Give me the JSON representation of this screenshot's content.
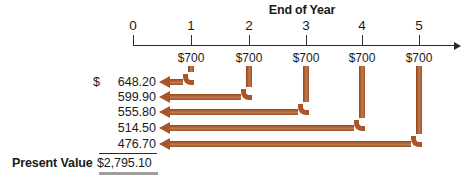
{
  "chart_data": {
    "type": "diagram",
    "title": "End of Year",
    "axis": {
      "tick_labels": [
        "0",
        "1",
        "2",
        "3",
        "4",
        "5"
      ],
      "tick_x": [
        133,
        191,
        249,
        306,
        362,
        419
      ],
      "line_start_x": 133,
      "line_end_x": 455,
      "line_y": 45
    },
    "cash_flows": [
      {
        "year": 1,
        "label": "$700",
        "amount": 700
      },
      {
        "year": 2,
        "label": "$700",
        "amount": 700
      },
      {
        "year": 3,
        "label": "$700",
        "amount": 700
      },
      {
        "year": 4,
        "label": "$700",
        "amount": 700
      },
      {
        "year": 5,
        "label": "$700",
        "amount": 700
      }
    ],
    "discounted_values": [
      {
        "from_year": 1,
        "currency_symbol": "$",
        "value_label": "648.20",
        "value": 648.2,
        "row_y": 82
      },
      {
        "from_year": 2,
        "currency_symbol": "",
        "value_label": "599.90",
        "value": 599.9,
        "row_y": 97
      },
      {
        "from_year": 3,
        "currency_symbol": "",
        "value_label": "555.80",
        "value": 555.8,
        "row_y": 112
      },
      {
        "from_year": 4,
        "currency_symbol": "",
        "value_label": "514.50",
        "value": 514.5,
        "row_y": 128
      },
      {
        "from_year": 5,
        "currency_symbol": "",
        "value_label": "476.70",
        "value": 476.7,
        "row_y": 144
      }
    ],
    "total": {
      "label": "Present Value",
      "value_label": "$2,795.10",
      "value": 2795.1
    },
    "colors": {
      "background": "#ffffff",
      "text": "#1a1a1a",
      "axis": "#2b2b2b",
      "arrow": "#a8552a",
      "arrow_highlight": "#c07a4a",
      "arrow_shade": "#8c451f",
      "total_shadow": "#9e9e9e"
    }
  }
}
